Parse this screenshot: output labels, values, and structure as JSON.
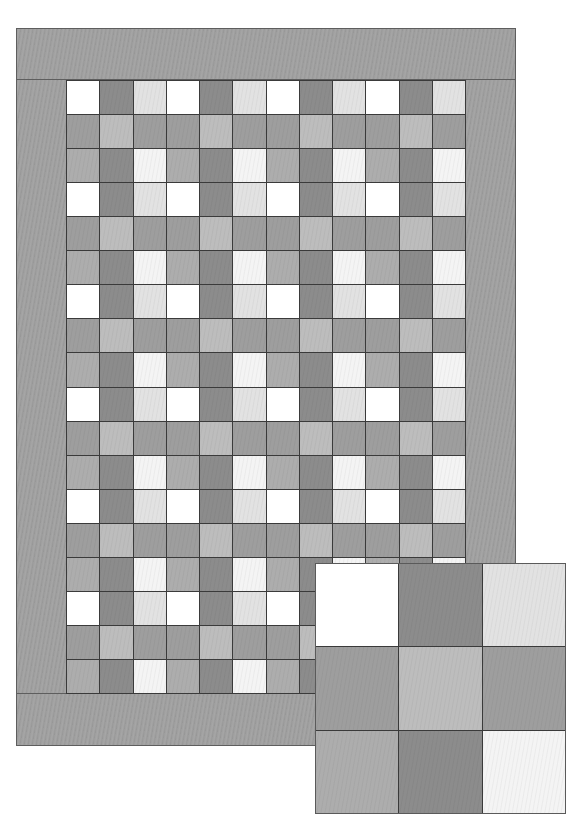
{
  "quilt": {
    "columns": 12,
    "rows": 18,
    "blocks_across": 4,
    "blocks_down": 6,
    "border_color": "#a0a0a0",
    "seam_color": "#3a3a3a"
  },
  "palette": {
    "white": "#ffffff",
    "dark": "#8c8c8c",
    "light": "#e2e2e2",
    "medium": "#9e9e9e",
    "medium_light": "#bdbdbd",
    "medium_light_2": "#adadad",
    "very_light": "#f4f4f4"
  },
  "block_pattern": [
    [
      "white",
      "dark",
      "light"
    ],
    [
      "medium",
      "medium_light",
      "medium"
    ],
    [
      "medium_light_2",
      "dark",
      "very_light"
    ]
  ],
  "inset": {
    "label": "Block detail",
    "cells": [
      [
        "white",
        "dark",
        "light"
      ],
      [
        "medium",
        "medium_light",
        "medium"
      ],
      [
        "medium_light_2",
        "dark",
        "very_light"
      ]
    ]
  }
}
